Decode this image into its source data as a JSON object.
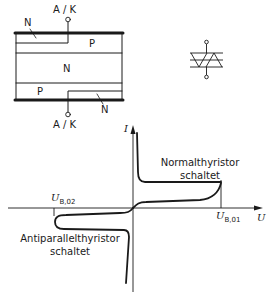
{
  "structure_diagram": {
    "terminal_top": "A / K",
    "terminal_bottom": "A / K",
    "layers": {
      "top_n": "N",
      "top_p": "P",
      "middle_n": "N",
      "bottom_p": "P",
      "bottom_n": "N"
    }
  },
  "symbol": {
    "name": "triac-diac-symbol"
  },
  "characteristic": {
    "axis_y_label": "I",
    "axis_x_label": "U",
    "ub01_symbol": "U",
    "ub01_sub": "B,01",
    "ub02_symbol": "U",
    "ub02_sub": "B,02",
    "caption_normal_line1": "Normalthyristor",
    "caption_normal_line2": "schaltet",
    "caption_anti_line1": "Antiparallelthyristor",
    "caption_anti_line2": "schaltet"
  },
  "colors": {
    "ink": "#1a1a1a",
    "background": "#ffffff"
  }
}
